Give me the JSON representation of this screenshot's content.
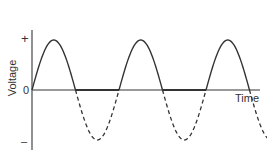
{
  "chart_data": {
    "type": "line",
    "title": "",
    "xlabel": "Time",
    "ylabel": "Voltage",
    "y_ticks": [
      "+",
      "0",
      "–"
    ],
    "series": [
      {
        "name": "half-wave rectified output",
        "style": "solid",
        "description": "positive half-cycles of sine wave, zero during negative half-cycles"
      },
      {
        "name": "removed negative half-cycles",
        "style": "dashed",
        "description": "negative half-cycles of original sine wave"
      }
    ],
    "cycles": 3,
    "ylim": [
      -1,
      1
    ]
  },
  "labels": {
    "plus": "+",
    "zero": "0",
    "minus": "–",
    "voltage": "Voltage",
    "time": "Time"
  }
}
